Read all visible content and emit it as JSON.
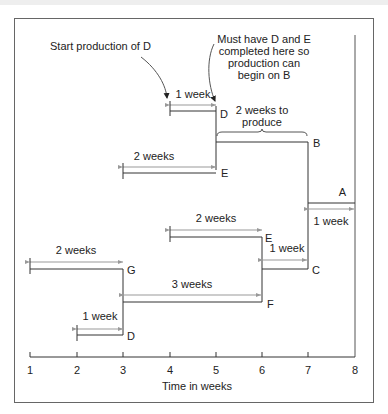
{
  "diagram": {
    "annotations": {
      "start_d": "Start production of D",
      "must_have": [
        "Must have D and E",
        "completed here so",
        "production can",
        "begin on B"
      ],
      "b_duration": [
        "2 weeks to",
        "produce"
      ]
    },
    "axis": {
      "label": "Time in weeks",
      "ticks": [
        "1",
        "2",
        "3",
        "4",
        "5",
        "6",
        "7",
        "8"
      ]
    },
    "segments": [
      {
        "item": "D",
        "duration_label": "1 week",
        "start": 4,
        "end": 5
      },
      {
        "item": "E",
        "duration_label": "2 weeks",
        "start": 3,
        "end": 5
      },
      {
        "item": "B",
        "duration_label": "2 weeks to produce",
        "start": 5,
        "end": 7
      },
      {
        "item": "A",
        "duration_label": "1 week",
        "start": 7,
        "end": 8
      },
      {
        "item": "E",
        "duration_label": "2 weeks",
        "start": 4,
        "end": 6
      },
      {
        "item": "C",
        "duration_label": "1 week",
        "start": 6,
        "end": 7
      },
      {
        "item": "G",
        "duration_label": "2 weeks",
        "start": 1,
        "end": 3
      },
      {
        "item": "F",
        "duration_label": "3 weeks",
        "start": 3,
        "end": 6
      },
      {
        "item": "D",
        "duration_label": "1 week",
        "start": 2,
        "end": 3
      }
    ],
    "colors": {
      "line": "#333333",
      "arrow": "#999999",
      "frame": "#555555"
    }
  }
}
